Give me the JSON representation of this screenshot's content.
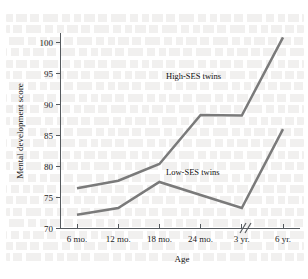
{
  "chart_data": {
    "type": "line",
    "title": "",
    "xlabel": "Age",
    "ylabel": "Mental development score",
    "categories": [
      "6 mo.",
      "12 mo.",
      "18 mo.",
      "24 mo.",
      "3 yr.",
      "6 yr."
    ],
    "ylim": [
      70,
      101.5
    ],
    "yticks": [
      70,
      75,
      80,
      85,
      90,
      95,
      100
    ],
    "ytick_labels": [
      "70",
      "75",
      "80",
      "85",
      "90",
      "95",
      "100"
    ],
    "grid": false,
    "legend_position": "inline-annotations",
    "axis_break": {
      "present": true,
      "between": [
        "3 yr.",
        "6 yr."
      ],
      "glyph": "//"
    },
    "series": [
      {
        "name": "High-SES twins",
        "color": "#7a7a7a",
        "label_text": "High-SES twins",
        "values": [
          76.5,
          77.7,
          80.4,
          88.3,
          88.2,
          100.8
        ]
      },
      {
        "name": "Low-SES twins",
        "color": "#7a7a7a",
        "label_text": "Low-SES twins",
        "values": [
          72.2,
          73.3,
          77.5,
          75.4,
          73.3,
          86.0
        ]
      }
    ]
  },
  "annotations": {
    "high_series_label": "High-SES twins",
    "low_series_label": "Low-SES twins"
  },
  "axes": {
    "y_title": "Mental development score",
    "x_title": "Age"
  },
  "colors": {
    "series_gray": "#7a7a7a",
    "axis": "#555a5e",
    "text": "#141414",
    "background": "#ffffff"
  }
}
